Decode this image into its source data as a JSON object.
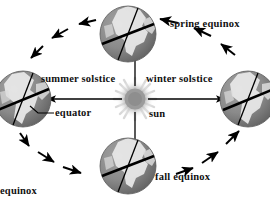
{
  "figure": {
    "background_color": "#ffffff",
    "width": 270,
    "height": 198
  },
  "labels": {
    "spring_equinox": "spring equinox",
    "summer_solstice": "summer solstice",
    "winter_solstice": "winter solstice",
    "equator": "equator",
    "sun": "sun",
    "fall_equinox": "fall equinox",
    "cut_off_bottom": "equinox"
  },
  "colors": {
    "text": "#111111",
    "line": "#000000",
    "globe_ocean": "#8d8d8d",
    "globe_land": "#e8e8e8",
    "globe_shadow": "#6a6a6a",
    "sun_core": "#9a9a9a",
    "sun_glow": "#c9c9c9",
    "axis_line": "#000000"
  },
  "diagram_data": {
    "type": "diagram",
    "center_body": {
      "name": "sun",
      "cx": 135,
      "cy": 99,
      "radius": 12,
      "has_rays": true
    },
    "orbit": {
      "cx": 135,
      "cy": 99,
      "rx": 108,
      "ry": 76,
      "direction": "clockwise",
      "style": "implied by arrow chain"
    },
    "earth_positions": [
      {
        "id": "spring",
        "label": "spring equinox",
        "cx": 128,
        "cy": 34,
        "radius": 28,
        "axis_tilt_deg": -23.5,
        "position": "top"
      },
      {
        "id": "summer",
        "label": "summer solstice",
        "cx": 23,
        "cy": 99,
        "radius": 28,
        "axis_tilt_deg": -23.5,
        "position": "left"
      },
      {
        "id": "winter",
        "label": "winter solstice",
        "cx": 248,
        "cy": 99,
        "radius": 28,
        "axis_tilt_deg": -23.5,
        "position": "right"
      },
      {
        "id": "fall",
        "label": "fall equinox",
        "cx": 128,
        "cy": 166,
        "radius": 28,
        "axis_tilt_deg": -23.5,
        "position": "bottom"
      }
    ],
    "sun_rays": [
      {
        "from": "sun",
        "to": "spring globe",
        "direction": "up"
      },
      {
        "from": "sun",
        "to": "summer globe",
        "direction": "left"
      },
      {
        "from": "sun",
        "to": "winter globe",
        "direction": "right"
      },
      {
        "from": "sun",
        "to": "fall globe",
        "direction": "down"
      }
    ],
    "orbit_arrows_count": 12,
    "leader_lines": [
      {
        "label": "equator",
        "points_to": "summer globe equator line"
      }
    ]
  }
}
